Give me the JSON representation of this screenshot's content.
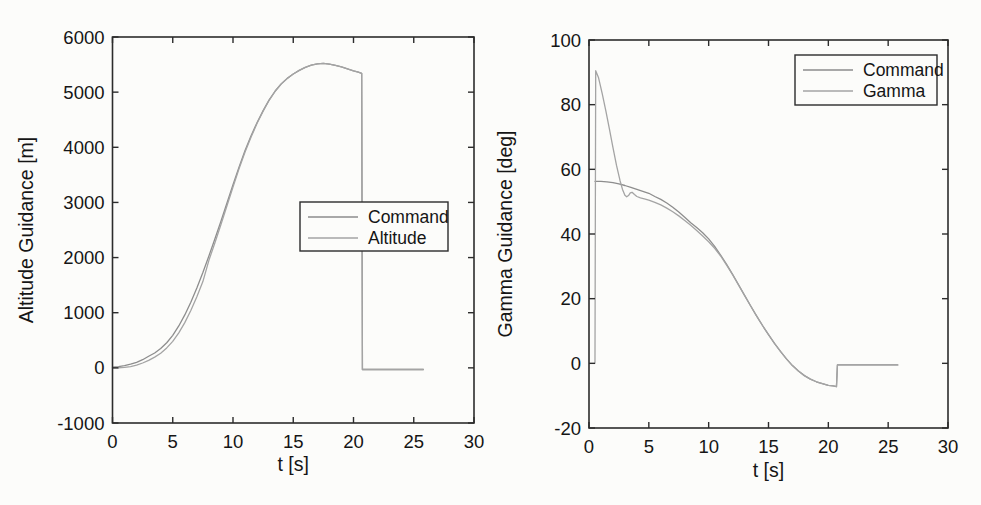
{
  "styles": {
    "background": "#fcfcfa",
    "axis_color": "#2c2c2c",
    "text_color": "#151515",
    "legend_border_color": "#2c2c2c"
  },
  "chart_data": [
    {
      "type": "line",
      "title": "",
      "xlabel": "t [s]",
      "ylabel": "Altitude Guidance [m]",
      "xlim": [
        0,
        30
      ],
      "ylim": [
        -1000,
        6000
      ],
      "xticks": [
        0,
        5,
        10,
        15,
        20,
        25,
        30
      ],
      "yticks": [
        -1000,
        0,
        1000,
        2000,
        3000,
        4000,
        5000,
        6000
      ],
      "grid": false,
      "legend_position": "inside-right-middle",
      "legend": [
        "Command",
        "Altitude"
      ],
      "series": [
        {
          "name": "Command",
          "color": "#8d8d8d",
          "points": [
            [
              0,
              12
            ],
            [
              0.5,
              22
            ],
            [
              1,
              40
            ],
            [
              1.5,
              66
            ],
            [
              2,
              100
            ],
            [
              2.5,
              148
            ],
            [
              3,
              210
            ],
            [
              3.5,
              270
            ],
            [
              4,
              350
            ],
            [
              4.5,
              455
            ],
            [
              5,
              590
            ],
            [
              5.5,
              760
            ],
            [
              6,
              960
            ],
            [
              6.5,
              1190
            ],
            [
              7,
              1450
            ],
            [
              7.5,
              1730
            ],
            [
              8,
              2030
            ],
            [
              8.5,
              2340
            ],
            [
              9,
              2660
            ],
            [
              9.5,
              2990
            ],
            [
              10,
              3320
            ],
            [
              10.5,
              3640
            ],
            [
              11,
              3940
            ],
            [
              11.5,
              4210
            ],
            [
              12,
              4450
            ],
            [
              12.5,
              4665
            ],
            [
              13,
              4860
            ],
            [
              13.5,
              5020
            ],
            [
              14,
              5150
            ],
            [
              14.5,
              5250
            ],
            [
              15,
              5330
            ],
            [
              15.5,
              5395
            ],
            [
              16,
              5450
            ],
            [
              16.5,
              5490
            ],
            [
              17,
              5513
            ],
            [
              17.5,
              5520
            ],
            [
              18,
              5507
            ],
            [
              18.5,
              5485
            ],
            [
              19,
              5457
            ],
            [
              19.5,
              5422
            ],
            [
              20,
              5387
            ],
            [
              20.4,
              5362
            ],
            [
              20.68,
              5340
            ],
            [
              20.74,
              -30
            ],
            [
              25.8,
              -30
            ]
          ]
        },
        {
          "name": "Altitude",
          "color": "#a4a4a4",
          "points": [
            [
              0,
              0
            ],
            [
              0.5,
              2
            ],
            [
              1,
              8
            ],
            [
              1.5,
              22
            ],
            [
              2,
              48
            ],
            [
              2.5,
              88
            ],
            [
              3,
              135
            ],
            [
              3.5,
              195
            ],
            [
              4,
              265
            ],
            [
              4.5,
              362
            ],
            [
              5,
              480
            ],
            [
              5.5,
              635
            ],
            [
              6,
              820
            ],
            [
              6.5,
              1040
            ],
            [
              7,
              1290
            ],
            [
              7.5,
              1565
            ],
            [
              8,
              1950
            ],
            [
              8.5,
              2270
            ],
            [
              9,
              2600
            ],
            [
              9.5,
              2940
            ],
            [
              10,
              3280
            ],
            [
              10.5,
              3610
            ],
            [
              11,
              3915
            ],
            [
              11.5,
              4188
            ],
            [
              12,
              4435
            ],
            [
              12.5,
              4655
            ],
            [
              13,
              4852
            ],
            [
              13.5,
              5016
            ],
            [
              14,
              5148
            ],
            [
              14.5,
              5249
            ],
            [
              15,
              5330
            ],
            [
              15.5,
              5395
            ],
            [
              16,
              5450
            ],
            [
              16.5,
              5490
            ],
            [
              17,
              5513
            ],
            [
              17.5,
              5520
            ],
            [
              18,
              5507
            ],
            [
              18.5,
              5485
            ],
            [
              19,
              5457
            ],
            [
              19.5,
              5422
            ],
            [
              20,
              5387
            ],
            [
              20.4,
              5362
            ],
            [
              20.68,
              5340
            ],
            [
              20.74,
              -30
            ],
            [
              25.8,
              -30
            ]
          ]
        }
      ]
    },
    {
      "type": "line",
      "title": "",
      "xlabel": "t [s]",
      "ylabel": "Gamma Guidance [deg]",
      "xlim": [
        0,
        30
      ],
      "ylim": [
        -20,
        100
      ],
      "xticks": [
        0,
        5,
        10,
        15,
        20,
        25,
        30
      ],
      "yticks": [
        -20,
        0,
        20,
        40,
        60,
        80,
        100
      ],
      "grid": false,
      "legend_position": "inside-top-right",
      "legend": [
        "Command",
        "Gamma"
      ],
      "series": [
        {
          "name": "Command",
          "color": "#8d8d8d",
          "points": [
            [
              0.5,
              56.3
            ],
            [
              1,
              56.25
            ],
            [
              1.5,
              56.15
            ],
            [
              2,
              55.9
            ],
            [
              2.5,
              55.5
            ],
            [
              3,
              55.0
            ],
            [
              3.5,
              54.4
            ],
            [
              4,
              53.8
            ],
            [
              4.5,
              53.2
            ],
            [
              5,
              52.6
            ],
            [
              5.5,
              51.6
            ],
            [
              6,
              50.7
            ],
            [
              6.5,
              49.6
            ],
            [
              7,
              48.3
            ],
            [
              7.5,
              46.8
            ],
            [
              8,
              45.2
            ],
            [
              8.5,
              43.5
            ],
            [
              9,
              42.0
            ],
            [
              9.5,
              40.4
            ],
            [
              10,
              38.5
            ],
            [
              10.5,
              36.2
            ],
            [
              11,
              33.5
            ],
            [
              11.5,
              30.6
            ],
            [
              12,
              27.5
            ],
            [
              12.5,
              24.3
            ],
            [
              13,
              21.0
            ],
            [
              13.5,
              17.8
            ],
            [
              14,
              14.7
            ],
            [
              14.5,
              11.7
            ],
            [
              15,
              8.9
            ],
            [
              15.5,
              6.2
            ],
            [
              16,
              3.7
            ],
            [
              16.5,
              1.4
            ],
            [
              17,
              -0.7
            ],
            [
              17.5,
              -2.4
            ],
            [
              18,
              -3.8
            ],
            [
              18.5,
              -4.9
            ],
            [
              19,
              -5.7
            ],
            [
              19.5,
              -6.3
            ],
            [
              20,
              -6.8
            ],
            [
              20.4,
              -7.0
            ],
            [
              20.68,
              -7.2
            ],
            [
              20.76,
              -0.5
            ],
            [
              25.8,
              -0.5
            ]
          ]
        },
        {
          "name": "Gamma",
          "color": "#a4a4a4",
          "points": [
            [
              0.5,
              0
            ],
            [
              0.56,
              90.5
            ],
            [
              0.8,
              88.3
            ],
            [
              1.1,
              83.5
            ],
            [
              1.4,
              78.2
            ],
            [
              1.7,
              72.6
            ],
            [
              2,
              66.8
            ],
            [
              2.3,
              61.2
            ],
            [
              2.6,
              56.4
            ],
            [
              2.8,
              53.8
            ],
            [
              3,
              52.0
            ],
            [
              3.15,
              51.5
            ],
            [
              3.3,
              51.9
            ],
            [
              3.45,
              52.7
            ],
            [
              3.6,
              52.9
            ],
            [
              3.8,
              52.2
            ],
            [
              4,
              51.6
            ],
            [
              4.3,
              51.2
            ],
            [
              4.7,
              50.8
            ],
            [
              5,
              50.5
            ],
            [
              5.5,
              49.8
            ],
            [
              6,
              49.0
            ],
            [
              6.5,
              48.0
            ],
            [
              7,
              46.9
            ],
            [
              7.5,
              45.6
            ],
            [
              8,
              44.2
            ],
            [
              8.5,
              42.7
            ],
            [
              9,
              41.1
            ],
            [
              9.5,
              39.4
            ],
            [
              10,
              37.6
            ],
            [
              10.5,
              35.6
            ],
            [
              11,
              33.2
            ],
            [
              11.5,
              30.4
            ],
            [
              12,
              27.4
            ],
            [
              12.5,
              24.2
            ],
            [
              13,
              21.0
            ],
            [
              13.5,
              17.8
            ],
            [
              14,
              14.7
            ],
            [
              14.5,
              11.7
            ],
            [
              15,
              8.9
            ],
            [
              15.5,
              6.2
            ],
            [
              16,
              3.7
            ],
            [
              16.5,
              1.4
            ],
            [
              17,
              -0.7
            ],
            [
              17.5,
              -2.4
            ],
            [
              18,
              -3.8
            ],
            [
              18.5,
              -4.9
            ],
            [
              19,
              -5.7
            ],
            [
              19.5,
              -6.3
            ],
            [
              20,
              -6.8
            ],
            [
              20.4,
              -7.0
            ],
            [
              20.68,
              -7.2
            ],
            [
              20.76,
              -0.5
            ],
            [
              25.8,
              -0.5
            ]
          ]
        }
      ]
    }
  ]
}
